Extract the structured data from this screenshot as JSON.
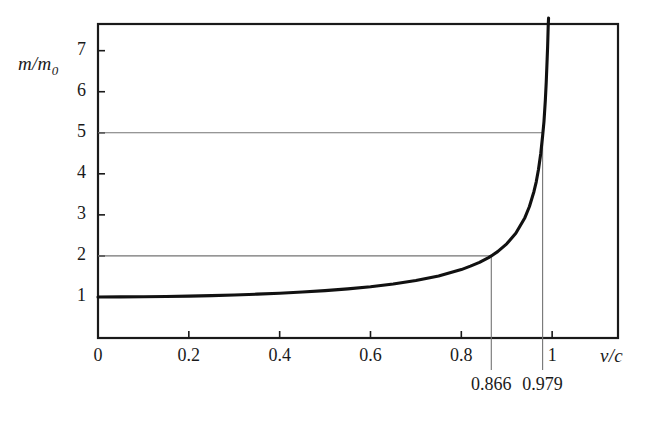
{
  "figure": {
    "background": "#ffffff",
    "ink_color": "#1a1a1a",
    "guide_color": "#737373",
    "curve_color": "#111111"
  },
  "labels": {
    "y_axis": "m/m",
    "y_axis_sub": "0",
    "x_axis": "v/c"
  },
  "annotations": [
    {
      "name": "annot-0866",
      "text": "0.866",
      "x_value": 0.866
    },
    {
      "name": "annot-0979",
      "text": "0.979",
      "x_value": 0.979
    }
  ],
  "chart_data": {
    "type": "line",
    "title": "",
    "xlabel": "v/c",
    "ylabel": "m/m0",
    "xlim": [
      0,
      1.145
    ],
    "ylim": [
      0,
      7.65
    ],
    "grid": false,
    "legend": "none",
    "x_ticks": [
      {
        "value": 0,
        "label": "0"
      },
      {
        "value": 0.2,
        "label": "0.2"
      },
      {
        "value": 0.4,
        "label": "0.4"
      },
      {
        "value": 0.6,
        "label": "0.6"
      },
      {
        "value": 0.8,
        "label": "0.8"
      },
      {
        "value": 1,
        "label": "1"
      }
    ],
    "y_ticks": [
      {
        "value": 1,
        "label": "1"
      },
      {
        "value": 2,
        "label": "2"
      },
      {
        "value": 3,
        "label": "3"
      },
      {
        "value": 4,
        "label": "4"
      },
      {
        "value": 5,
        "label": "5"
      },
      {
        "value": 6,
        "label": "6"
      },
      {
        "value": 7,
        "label": "7"
      }
    ],
    "series": [
      {
        "name": "relativistic mass ratio",
        "formula": "m/m0 = 1/sqrt(1-(v/c)^2)",
        "x": [
          0,
          0.05,
          0.1,
          0.15,
          0.2,
          0.25,
          0.3,
          0.35,
          0.4,
          0.45,
          0.5,
          0.55,
          0.6,
          0.65,
          0.7,
          0.75,
          0.8,
          0.82,
          0.84,
          0.86,
          0.866,
          0.88,
          0.9,
          0.92,
          0.94,
          0.95,
          0.96,
          0.965,
          0.97,
          0.975,
          0.979,
          0.982,
          0.985,
          0.987,
          0.989,
          0.99
        ],
        "y": [
          1.0,
          1.001,
          1.005,
          1.011,
          1.021,
          1.033,
          1.048,
          1.068,
          1.091,
          1.12,
          1.155,
          1.197,
          1.25,
          1.316,
          1.4,
          1.512,
          1.667,
          1.75,
          1.844,
          1.96,
          2.0,
          2.105,
          2.294,
          2.552,
          2.931,
          3.203,
          3.571,
          3.805,
          4.113,
          4.501,
          4.921,
          5.273,
          5.797,
          6.232,
          6.793,
          7.089
        ]
      }
    ],
    "reference_lines": [
      {
        "name": "y-guide-2",
        "orientation": "horizontal",
        "value": 2,
        "x_start": 0,
        "x_end": 0.866
      },
      {
        "name": "y-guide-5",
        "orientation": "horizontal",
        "value": 5,
        "x_start": 0,
        "x_end": 0.979
      },
      {
        "name": "x-drop-0866",
        "orientation": "vertical",
        "value": 0.866,
        "y_start": 0,
        "y_end": 2
      },
      {
        "name": "x-drop-0979",
        "orientation": "vertical",
        "value": 0.979,
        "y_start": 0,
        "y_end": 5
      }
    ]
  }
}
